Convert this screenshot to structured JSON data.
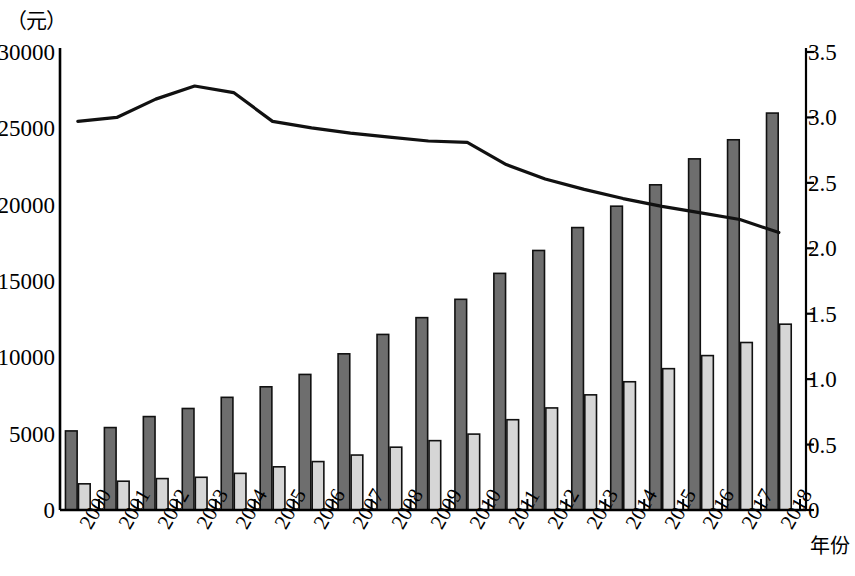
{
  "chart_data": {
    "type": "bar",
    "title": "",
    "subtitle": "",
    "unit_label_left": "（元）",
    "xlabel": "年份",
    "ylabel": "",
    "ylabel_right": "",
    "categories": [
      "2000",
      "2001",
      "2002",
      "2003",
      "2004",
      "2005",
      "2006",
      "2007",
      "2008",
      "2009",
      "2010",
      "2011",
      "2012",
      "2013",
      "2014",
      "2015",
      "2016",
      "2017",
      "2018"
    ],
    "left_axis": {
      "ticks": [
        "0",
        "5000",
        "10000",
        "15000",
        "20000",
        "25000",
        "30000"
      ],
      "tick_values": [
        0,
        5000,
        10000,
        15000,
        20000,
        25000,
        30000
      ],
      "ylim": [
        0,
        30000
      ],
      "unit": "元"
    },
    "right_axis": {
      "ticks": [
        "0",
        "0.5",
        "1.0",
        "1.5",
        "2.0",
        "2.5",
        "3.0",
        "3.5"
      ],
      "tick_values": [
        0,
        0.5,
        1.0,
        1.5,
        2.0,
        2.5,
        3.0,
        3.5
      ],
      "ylim": [
        0,
        3.5
      ]
    },
    "grid": false,
    "legend": null,
    "series": [
      {
        "name": "dark-bar-series",
        "kind": "bar",
        "axis": "left",
        "color": "#6e6e6e",
        "stroke": "#111111",
        "values": [
          5180,
          5400,
          6120,
          6650,
          7380,
          8070,
          8880,
          10230,
          11500,
          12600,
          13800,
          15500,
          17000,
          18500,
          19900,
          21300,
          23000,
          24250,
          26000
        ]
      },
      {
        "name": "light-bar-series",
        "kind": "bar",
        "axis": "right",
        "color": "#d6d6d6",
        "stroke": "#111111",
        "values": [
          0.2,
          0.22,
          0.24,
          0.25,
          0.28,
          0.33,
          0.37,
          0.42,
          0.48,
          0.53,
          0.58,
          0.69,
          0.78,
          0.88,
          0.98,
          1.08,
          1.18,
          1.28,
          1.42
        ]
      },
      {
        "name": "line-series",
        "kind": "line",
        "axis": "right",
        "color": "#111111",
        "values": [
          2.97,
          3.0,
          3.14,
          3.24,
          3.19,
          2.97,
          2.92,
          2.88,
          2.85,
          2.82,
          2.81,
          2.64,
          2.53,
          2.45,
          2.38,
          2.32,
          2.27,
          2.22,
          2.12
        ]
      }
    ]
  },
  "layout": {
    "plot_left": 60,
    "plot_right": 800,
    "plot_top": 52,
    "plot_bottom": 510
  }
}
